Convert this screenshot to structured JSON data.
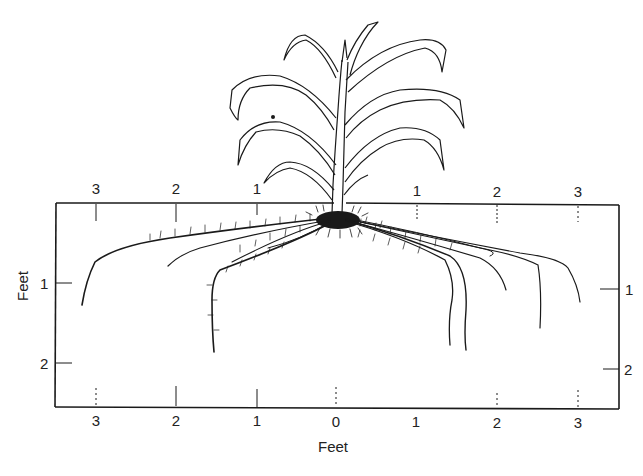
{
  "diagram": {
    "colors": {
      "ink": "#1a1a1a",
      "background": "#ffffff"
    },
    "frame": {
      "left": 56,
      "top": 203,
      "right": 619,
      "bottom": 407
    },
    "top_axis": {
      "ticks": [
        {
          "label": "3",
          "x": 96
        },
        {
          "label": "2",
          "x": 176
        },
        {
          "label": "1",
          "x": 257
        },
        {
          "label": "1",
          "x": 417
        },
        {
          "label": "2",
          "x": 497
        },
        {
          "label": "3",
          "x": 578
        }
      ]
    },
    "bottom_axis": {
      "title": "Feet",
      "ticks": [
        {
          "label": "3",
          "x": 96
        },
        {
          "label": "2",
          "x": 176
        },
        {
          "label": "1",
          "x": 257
        },
        {
          "label": "0",
          "x": 336
        },
        {
          "label": "1",
          "x": 416
        },
        {
          "label": "2",
          "x": 497
        },
        {
          "label": "3",
          "x": 578
        }
      ]
    },
    "left_axis": {
      "title": "Feet",
      "ticks": [
        {
          "label": "1",
          "y": 283
        },
        {
          "label": "2",
          "y": 363
        }
      ]
    },
    "right_axis": {
      "ticks": [
        {
          "label": "1",
          "y": 289
        },
        {
          "label": "2",
          "y": 370
        }
      ]
    }
  }
}
